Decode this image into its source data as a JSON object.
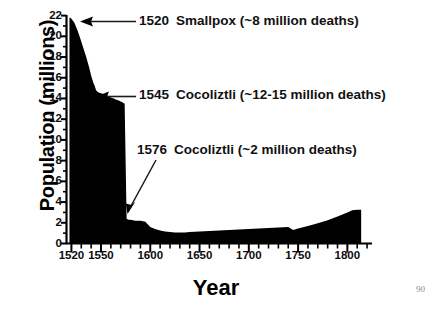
{
  "page": {
    "page_number": "90",
    "background_color": "#ffffff",
    "ink_color": "#000000"
  },
  "chart_data": {
    "type": "area",
    "title": "",
    "xlabel": "Year",
    "ylabel": "Population (millions)",
    "xlim": [
      1515,
      1825
    ],
    "ylim": [
      0,
      22
    ],
    "grid": false,
    "legend": "none",
    "x_ticks": [
      1520,
      1550,
      1600,
      1650,
      1700,
      1750,
      1800
    ],
    "x_tick_labels": [
      "1520",
      "1550",
      "1600",
      "1650",
      "1700",
      "1750",
      "1800"
    ],
    "x_minor_tick_interval": 10,
    "y_ticks": [
      0,
      2,
      4,
      6,
      8,
      10,
      12,
      14,
      16,
      18,
      20,
      22
    ],
    "y_tick_labels": [
      "0",
      "2",
      "4",
      "6",
      "8",
      "10",
      "12",
      "14",
      "16",
      "18",
      "20",
      "22"
    ],
    "y_minor_tick_interval": 1,
    "series": [
      {
        "name": "Population of central Mexico",
        "fill_color": "#000000",
        "x": [
          1518,
          1519,
          1520,
          1523,
          1526,
          1529,
          1532,
          1535,
          1538,
          1540,
          1542,
          1544,
          1545,
          1547,
          1550,
          1553,
          1556,
          1558,
          1560,
          1563,
          1565,
          1568,
          1570,
          1572,
          1574,
          1576,
          1578,
          1580,
          1585,
          1590,
          1595,
          1600,
          1605,
          1610,
          1615,
          1620,
          1625,
          1630,
          1635,
          1640,
          1650,
          1660,
          1670,
          1680,
          1690,
          1700,
          1710,
          1720,
          1730,
          1740,
          1745,
          1750,
          1760,
          1770,
          1780,
          1790,
          1800,
          1805,
          1810,
          1814
        ],
        "y": [
          21.8,
          21.8,
          21.7,
          21.3,
          20.6,
          19.8,
          18.9,
          18.0,
          17.0,
          16.2,
          15.6,
          15.1,
          14.8,
          14.6,
          14.5,
          14.4,
          14.3,
          14.2,
          14.1,
          14.0,
          13.9,
          13.8,
          13.7,
          13.6,
          13.5,
          2.4,
          2.3,
          2.3,
          2.2,
          2.2,
          2.1,
          1.6,
          1.4,
          1.25,
          1.15,
          1.1,
          1.05,
          1.05,
          1.05,
          1.1,
          1.15,
          1.2,
          1.25,
          1.3,
          1.35,
          1.4,
          1.45,
          1.5,
          1.55,
          1.6,
          1.3,
          1.45,
          1.7,
          1.95,
          2.25,
          2.6,
          3.0,
          3.2,
          3.25,
          3.25
        ]
      }
    ],
    "annotations": [
      {
        "id": "ann-1520",
        "year": "1520",
        "event": "Smallpox",
        "detail": "(~8 million deaths)",
        "arrow": "horizontal-left",
        "points_to_value": 21.8
      },
      {
        "id": "ann-1545",
        "year": "1545",
        "event": "Cocoliztli",
        "detail": "(~12-15 million deaths)",
        "arrow": "horizontal-left",
        "points_to_value": 14.7
      },
      {
        "id": "ann-1576",
        "year": "1576",
        "event": "Cocoliztli",
        "detail": "(~2 million deaths)",
        "arrow": "diagonal-down-left",
        "points_to_value": 2.4
      }
    ]
  }
}
